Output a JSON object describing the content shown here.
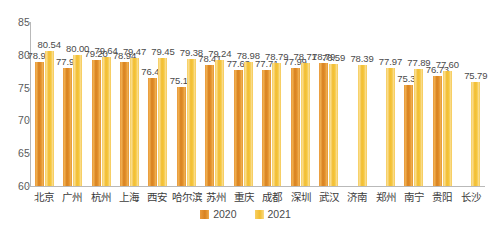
{
  "chart_data": {
    "type": "bar",
    "title": "",
    "subtitle": "",
    "xlabel": "",
    "ylabel": "",
    "ylim": [
      60,
      85
    ],
    "yticks": [
      "60",
      "65",
      "70",
      "75",
      "80",
      "85"
    ],
    "grid": false,
    "legend_position": "bottom-center",
    "categories": [
      "北京",
      "广州",
      "杭州",
      "上海",
      "西安",
      "哈尔滨",
      "苏州",
      "重庆",
      "成都",
      "深圳",
      "武汉",
      "济南",
      "郑州",
      "南宁",
      "贵阳",
      "长沙"
    ],
    "series": [
      {
        "name": "2020",
        "color": "#e0902b",
        "values": [
          78.93,
          77.98,
          79.2,
          78.94,
          76.4,
          75.14,
          78.41,
          77.63,
          77.71,
          77.99,
          78.79,
          null,
          null,
          75.38,
          76.73,
          null
        ],
        "labels": [
          "78.93",
          "77.98",
          "79.20",
          "78.94",
          "76.40",
          "75.14",
          "78.41",
          "77.63",
          "77.71",
          "77.99",
          "78.79",
          "",
          "",
          "75.38",
          "76.73",
          ""
        ]
      },
      {
        "name": "2021",
        "color": "#f4c43b",
        "values": [
          80.54,
          80.0,
          79.64,
          79.47,
          79.45,
          79.38,
          79.24,
          78.98,
          78.79,
          78.71,
          78.59,
          78.39,
          77.97,
          77.89,
          77.6,
          75.79
        ],
        "labels": [
          "80.54",
          "80.00",
          "79.64",
          "79.47",
          "79.45",
          "79.38",
          "79.24",
          "78.98",
          "78.79",
          "78.71",
          "78.59",
          "78.39",
          "77.97",
          "77.89",
          "77.60",
          "75.79"
        ]
      }
    ]
  },
  "legend": {
    "items": [
      {
        "label": "2020"
      },
      {
        "label": "2021"
      }
    ]
  }
}
